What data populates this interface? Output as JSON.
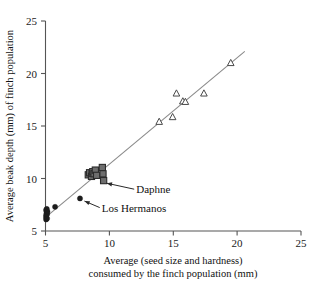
{
  "chart_data": {
    "type": "scatter",
    "title": "",
    "xlabel": "Average (seed size and hardness) consumed by the finch population (mm)",
    "xlabel_line1": "Average (seed size and hardness)",
    "xlabel_line2": "consumed by the finch population (mm)",
    "ylabel": "Average beak depth (mm) of finch population",
    "xlim": [
      5,
      25
    ],
    "ylim": [
      5,
      25
    ],
    "xticks": [
      5,
      10,
      15,
      20,
      25
    ],
    "yticks": [
      5,
      10,
      15,
      20,
      25
    ],
    "xtick_labels": [
      "5",
      "10",
      "15",
      "20",
      "25"
    ],
    "ytick_labels": [
      "5",
      "10",
      "15",
      "20",
      "25"
    ],
    "grid": false,
    "legend": "none",
    "axis_style": "left-and-bottom-spines-only",
    "series": [
      {
        "name": "Los Hermanos",
        "marker": "filled-circle",
        "color": "#1c1c1c",
        "points": [
          [
            5.05,
            6.1
          ],
          [
            5.05,
            6.3
          ],
          [
            5.05,
            6.5
          ],
          [
            5.08,
            6.7
          ],
          [
            5.08,
            6.9
          ],
          [
            5.05,
            7.0
          ],
          [
            5.1,
            7.1
          ],
          [
            5.12,
            6.2
          ],
          [
            5.12,
            6.6
          ],
          [
            5.15,
            6.85
          ],
          [
            5.75,
            7.3
          ],
          [
            7.7,
            8.1
          ]
        ]
      },
      {
        "name": "Daphne",
        "marker": "filled-square",
        "color": "#6e6e6e",
        "points": [
          [
            8.35,
            10.35
          ],
          [
            8.45,
            10.55
          ],
          [
            8.6,
            10.2
          ],
          [
            8.65,
            10.5
          ],
          [
            8.7,
            10.65
          ],
          [
            8.8,
            10.45
          ],
          [
            8.9,
            10.8
          ],
          [
            9.0,
            10.3
          ],
          [
            9.45,
            11.05
          ],
          [
            9.5,
            10.45
          ],
          [
            9.55,
            9.8
          ]
        ]
      },
      {
        "name": "Open triangles",
        "marker": "open-triangle",
        "color": "#4a4a4a",
        "points": [
          [
            13.9,
            15.4
          ],
          [
            14.95,
            15.85
          ],
          [
            15.25,
            18.1
          ],
          [
            15.75,
            17.35
          ],
          [
            15.95,
            17.3
          ],
          [
            17.4,
            18.1
          ],
          [
            19.5,
            21.0
          ]
        ]
      }
    ],
    "trend_line": {
      "type": "line",
      "x": [
        5.0,
        20.6
      ],
      "y": [
        6.3,
        22.1
      ]
    },
    "annotations": [
      {
        "label": "Daphne",
        "text_x": 12.1,
        "text_y": 8.6,
        "target_x": 9.8,
        "target_y": 9.55
      },
      {
        "label": "Los Hermanos",
        "text_x": 9.4,
        "text_y": 6.85,
        "target_x": 8.05,
        "target_y": 7.85
      }
    ]
  }
}
